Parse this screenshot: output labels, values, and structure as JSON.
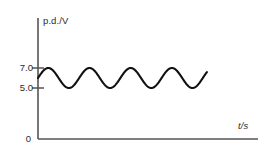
{
  "chart_data": {
    "type": "line",
    "title": "",
    "subtitle": "",
    "xlabel": "t/s",
    "ylabel": "p.d./V",
    "grid": false,
    "legend": null,
    "xlim": [
      0,
      11
    ],
    "ylim": [
      0,
      8.6
    ],
    "x_tick_labels": [],
    "y_tick_labels": [
      "7.0",
      "5.0"
    ],
    "y_ticks": [
      7.0,
      5.0
    ],
    "origin_label": "0",
    "series": [
      {
        "name": "p.d.",
        "waveform": "sine",
        "midline": 6.0,
        "amplitude": 1.0,
        "maximum": 7.0,
        "minimum": 5.0,
        "peak_to_peak": 2.0,
        "cycles_shown": 4.1,
        "start_value": 6.0,
        "start_phase": "rising",
        "x_start": 0.0,
        "x_end": 8.45,
        "color": "#111111"
      }
    ],
    "annotations": []
  },
  "axes": {
    "axis_color": "#555555",
    "tick_color": "#555555",
    "background": "#ffffff"
  },
  "labels": {
    "y_axis": "p.d./V",
    "x_axis": "t/s",
    "tick_7": "7.0",
    "tick_5": "5.0",
    "origin": "0"
  }
}
